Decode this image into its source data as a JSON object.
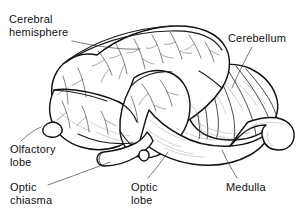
{
  "figure": {
    "background_color": "#ffffff",
    "ink_color": "#121212",
    "style": "black and white line drawing"
  },
  "labels": [
    {
      "id": "cerebral-hemisphere",
      "line1": "Cerebral",
      "line2": "hemisphere",
      "leader": "from label to dorsal surface of cerebrum"
    },
    {
      "id": "cerebellum",
      "line1": "Cerebellum",
      "line2": "",
      "leader": "from label down-left to folded cerebellum"
    },
    {
      "id": "olfactory-lobe",
      "line1": "Olfactory",
      "line2": "lobe",
      "leader": "from label up-right to small anterior knob"
    },
    {
      "id": "optic-chiasma",
      "line1": "Optic",
      "line2": "chiasma",
      "leader": "from label up-right to ventral nerve tube"
    },
    {
      "id": "optic-lobe",
      "line1": "Optic",
      "line2": "lobe",
      "leader": "from label up-right to rounded ventral lobe"
    },
    {
      "id": "medulla",
      "line1": "Medulla",
      "line2": "",
      "leader": "from label up-left to posterior brain stem"
    }
  ]
}
